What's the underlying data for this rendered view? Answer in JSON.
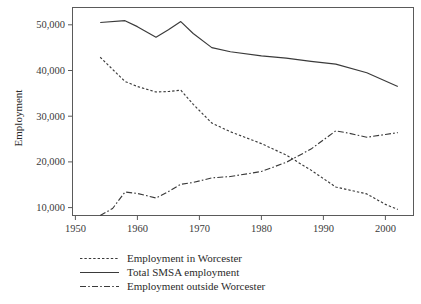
{
  "figure": {
    "y_axis_title": "Employment",
    "x_axis_title": ""
  },
  "legend": {
    "items": [
      {
        "label": "Employment in Worcester",
        "style": "dashed",
        "icon": "dashed-line-swatch-icon"
      },
      {
        "label": "Total SMSA employment",
        "style": "solid",
        "icon": "solid-line-swatch-icon"
      },
      {
        "label": "Employment outside Worcester",
        "style": "dashdot",
        "icon": "dash-dot-line-swatch-icon"
      }
    ]
  },
  "axes": {
    "y_ticks": [
      "10,000",
      "20,000",
      "30,000",
      "40,000",
      "50,000"
    ],
    "y_tick_values": [
      10000,
      20000,
      30000,
      40000,
      50000
    ],
    "x_ticks": [
      "1950",
      "1960",
      "1970",
      "1980",
      "1990",
      "2000"
    ],
    "x_tick_values": [
      1950,
      1960,
      1970,
      1980,
      1990,
      2000
    ]
  },
  "chart_data": {
    "type": "line",
    "title": "",
    "xlabel": "",
    "ylabel": "Employment",
    "xlim": [
      1950,
      2003.5
    ],
    "ylim": [
      6800,
      52500
    ],
    "grid": false,
    "legend_position": "below-plot",
    "line_color": "#3a3a3a",
    "series": [
      {
        "name": "Employment in Worcester",
        "style": "dashed",
        "x": [
          1954,
          1958,
          1960,
          1963,
          1965,
          1967,
          1969,
          1972,
          1975,
          1980,
          1984,
          1988,
          1992,
          1994,
          1997,
          2000,
          2002
        ],
        "values": [
          42900,
          37600,
          36500,
          35300,
          35400,
          35700,
          32600,
          28500,
          26600,
          24000,
          21500,
          18200,
          14500,
          13900,
          13000,
          10700,
          9600
        ]
      },
      {
        "name": "Total SMSA employment",
        "style": "solid",
        "x": [
          1954,
          1958,
          1960,
          1963,
          1965,
          1967,
          1969,
          1972,
          1975,
          1980,
          1984,
          1988,
          1992,
          1997,
          2002
        ],
        "values": [
          50500,
          50900,
          49600,
          47300,
          48900,
          50700,
          48100,
          45000,
          44100,
          43200,
          42700,
          42000,
          41400,
          39500,
          36500
        ]
      },
      {
        "name": "Employment outside Worcester",
        "style": "dashdot",
        "x": [
          1954,
          1956,
          1958,
          1960,
          1963,
          1965,
          1967,
          1969,
          1972,
          1975,
          1980,
          1984,
          1988,
          1992,
          1994,
          1997,
          2000,
          2002
        ],
        "values": [
          7600,
          9800,
          13400,
          13100,
          12100,
          13500,
          15100,
          15500,
          16500,
          16800,
          17900,
          19900,
          22800,
          26800,
          26300,
          25400,
          26000,
          26400
        ]
      }
    ]
  }
}
